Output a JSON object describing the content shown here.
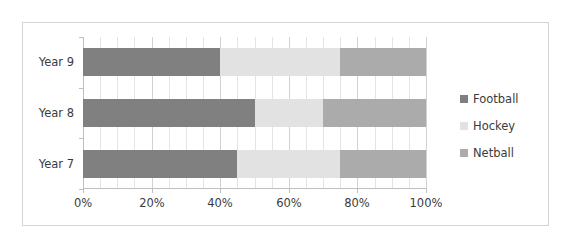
{
  "chart_data": {
    "type": "bar",
    "orientation": "horizontal",
    "stacked": true,
    "stack_mode": "percent",
    "title": "",
    "subtitle": "",
    "xlabel": "",
    "ylabel": "",
    "categories": [
      "Year 7",
      "Year 8",
      "Year 9"
    ],
    "category_order_top_to_bottom": [
      "Year 9",
      "Year 8",
      "Year 7"
    ],
    "series": [
      {
        "name": "Football",
        "color": "#808080",
        "values": [
          45,
          50,
          40
        ]
      },
      {
        "name": "Hockey",
        "color": "#e2e2e2",
        "values": [
          30,
          20,
          35
        ]
      },
      {
        "name": "Netball",
        "color": "#ababab",
        "values": [
          25,
          30,
          25
        ]
      }
    ],
    "xlim": [
      0,
      100
    ],
    "xticks": [
      0,
      20,
      40,
      60,
      80,
      100
    ],
    "xticklabels": [
      "0%",
      "20%",
      "40%",
      "60%",
      "80%",
      "100%"
    ],
    "minor_gridline_step": 5,
    "grid": true,
    "grid_axis": "x",
    "legend": {
      "position": "right",
      "entries": [
        {
          "label": "Football",
          "color": "#808080"
        },
        {
          "label": "Hockey",
          "color": "#e2e2e2"
        },
        {
          "label": "Netball",
          "color": "#ababab"
        }
      ]
    },
    "segments_top_to_bottom": [
      {
        "category": "Year 9",
        "parts": [
          {
            "series": "Football",
            "start": 0,
            "end": 40,
            "value": 40
          },
          {
            "series": "Hockey",
            "start": 40,
            "end": 75,
            "value": 35
          },
          {
            "series": "Netball",
            "start": 75,
            "end": 100,
            "value": 25
          }
        ]
      },
      {
        "category": "Year 8",
        "parts": [
          {
            "series": "Football",
            "start": 0,
            "end": 50,
            "value": 50
          },
          {
            "series": "Hockey",
            "start": 50,
            "end": 70,
            "value": 20
          },
          {
            "series": "Netball",
            "start": 70,
            "end": 100,
            "value": 30
          }
        ]
      },
      {
        "category": "Year 7",
        "parts": [
          {
            "series": "Football",
            "start": 0,
            "end": 45,
            "value": 45
          },
          {
            "series": "Hockey",
            "start": 45,
            "end": 75,
            "value": 30
          },
          {
            "series": "Netball",
            "start": 75,
            "end": 100,
            "value": 25
          }
        ]
      }
    ]
  },
  "style": {
    "frame_border_color": "#d4d4d4",
    "axis_color": "#bfbfbf",
    "gridline_color": "#e4e4e4",
    "text_color": "#3b3b3b",
    "background": "#ffffff"
  }
}
